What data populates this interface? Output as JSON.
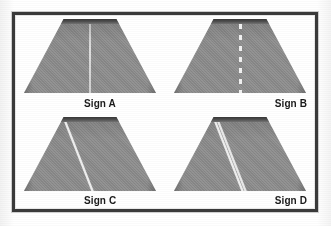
{
  "figure": {
    "background_color": "#ffffff",
    "frame_color": "#3a3a3a",
    "road_color": "#8e8e8e",
    "marking_color": "#f0f0f0",
    "label_color": "#1a1a1a"
  },
  "panels": [
    {
      "id": "sign-a",
      "label": "Sign A",
      "label_align": "center-right",
      "marking_type": "solid-centre-line",
      "marking_description": "Faint continuous centre line running the length of the road",
      "marking_count": 1,
      "marking_position": "centre"
    },
    {
      "id": "sign-b",
      "label": "Sign B",
      "label_align": "right",
      "marking_type": "broken-centre-line",
      "marking_description": "Broken (dashed) white centre line with six visible dashes",
      "marking_count": 6,
      "marking_position": "centre"
    },
    {
      "id": "sign-c",
      "label": "Sign C",
      "label_align": "center-right",
      "marking_type": "single-edge-line",
      "marking_description": "Single continuous white line along the left-hand edge of the road",
      "marking_count": 1,
      "marking_position": "left-edge"
    },
    {
      "id": "sign-d",
      "label": "Sign D",
      "label_align": "right",
      "marking_type": "double-edge-line",
      "marking_description": "Two parallel continuous white lines along the left-hand edge of the road",
      "marking_count": 2,
      "marking_position": "left-edge"
    }
  ]
}
